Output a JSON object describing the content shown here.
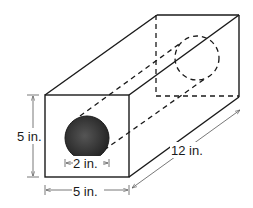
{
  "diagram": {
    "labels": {
      "height": "5 in.",
      "width": "5 in.",
      "length": "12 in.",
      "hole_diameter": "2 in."
    },
    "colors": {
      "line": "#1a1a1a",
      "hole_fill": "#3a3a3a",
      "dimension_line": "#555555",
      "background": "#ffffff"
    }
  }
}
